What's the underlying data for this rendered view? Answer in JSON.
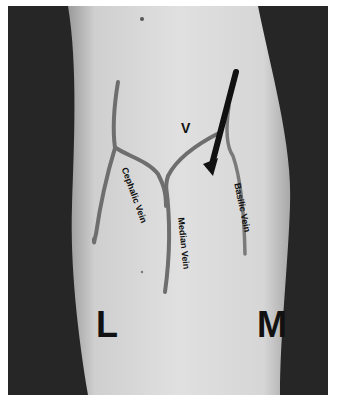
{
  "figure": {
    "labels": {
      "v_mark": "V",
      "cephalic": "Cephalic Vein",
      "median": "Median Vein",
      "basilic": "Basilic Vein",
      "lateral": "L",
      "medial": "M"
    },
    "colors": {
      "background": "#262626",
      "skin": "#d9d9d9",
      "vein": "#6e6e6e",
      "arrow": "#111111",
      "text": "#111111"
    }
  }
}
